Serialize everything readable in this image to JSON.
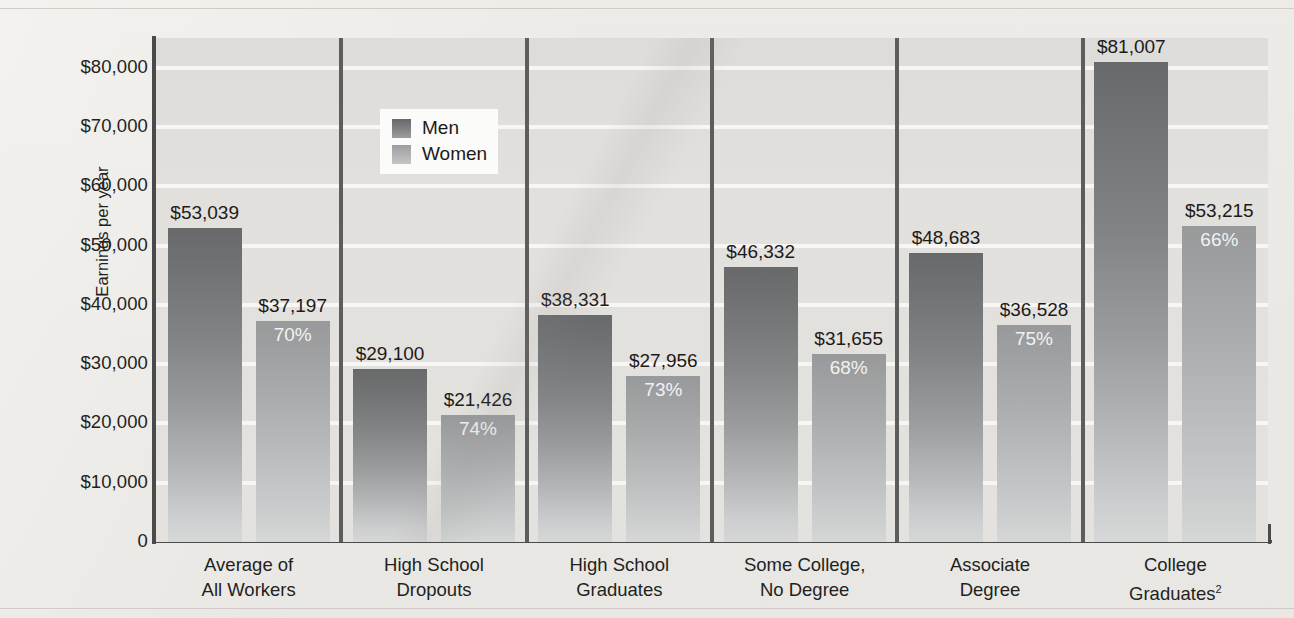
{
  "chart_data": {
    "type": "bar",
    "title": "",
    "xlabel": "",
    "ylabel": "Earnings per year",
    "ylim": [
      0,
      85000
    ],
    "grid": true,
    "legend_position": "top-left-inside",
    "categories": [
      "Average of\nAll Workers",
      "High School\nDropouts",
      "High School\nGraduates",
      "Some College,\nNo Degree",
      "Associate\nDegree",
      "College\nGraduates2"
    ],
    "category_lines": [
      [
        "Average of",
        "All Workers"
      ],
      [
        "High School",
        "Dropouts"
      ],
      [
        "High School",
        "Graduates"
      ],
      [
        "Some College,",
        "No Degree"
      ],
      [
        "Associate",
        "Degree"
      ],
      [
        "College",
        "Graduates"
      ]
    ],
    "category_footnote_index": 5,
    "category_footnote": "2",
    "yticks": [
      0,
      10000,
      20000,
      30000,
      40000,
      50000,
      60000,
      70000,
      80000
    ],
    "ytick_labels": [
      "0",
      "$10,000",
      "$20,000",
      "$30,000",
      "$40,000",
      "$50,000",
      "$60,000",
      "$70,000",
      "$80,000"
    ],
    "series": [
      {
        "name": "Men",
        "color": "#6e7072",
        "values": [
          53039,
          29100,
          38331,
          46332,
          48683,
          81007
        ],
        "value_labels": [
          "$53,039",
          "$29,100",
          "$38,331",
          "$46,332",
          "$48,683",
          "$81,007"
        ],
        "pct_labels": [
          "",
          "",
          "",
          "",
          "",
          ""
        ]
      },
      {
        "name": "Women",
        "color": "#aaacae",
        "values": [
          37197,
          21426,
          27956,
          31655,
          36528,
          53215
        ],
        "value_labels": [
          "$37,197",
          "$21,426",
          "$27,956",
          "$31,655",
          "$36,528",
          "$53,215"
        ],
        "pct_labels": [
          "70%",
          "74%",
          "73%",
          "68%",
          "75%",
          "66%"
        ]
      }
    ]
  },
  "legend": {
    "items": [
      {
        "label": "Men"
      },
      {
        "label": "Women"
      }
    ]
  }
}
